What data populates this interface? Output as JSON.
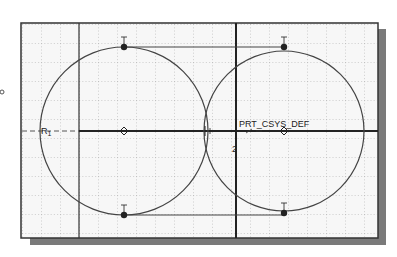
{
  "canvas": {
    "background": "#ffffff",
    "frame_fill": "#f7f7f7",
    "frame_stroke": "#333333",
    "shadow_color": "#7a7a7a",
    "grid_color": "#9a9a9a",
    "geometry_color": "#444444",
    "construction_color": "#222222"
  },
  "labels": {
    "coordinate_system": "PRT_CSYS_DEF",
    "radius_label": "R",
    "radius_subscript": "1",
    "constraint_marker": "2",
    "tangent_marker": "T"
  },
  "sketch": {
    "circles": [
      {
        "name": "left-circle",
        "cx": 124,
        "cy": 131,
        "r": 84
      },
      {
        "name": "right-circle",
        "cx": 284,
        "cy": 131,
        "r": 80
      }
    ],
    "vertical_lines": [
      {
        "name": "left-reference-line",
        "x": 79
      },
      {
        "name": "right-reference-line",
        "x": 236
      }
    ],
    "horizontal_axis_y": 131,
    "tangent_lines": [
      {
        "name": "top-tangent-line",
        "y": 47
      },
      {
        "name": "bottom-tangent-line",
        "y": 215
      }
    ]
  }
}
